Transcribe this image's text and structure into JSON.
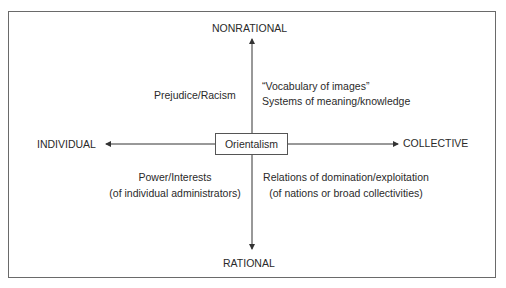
{
  "diagram": {
    "center": "Orientalism",
    "axes": {
      "top": "NONRATIONAL",
      "bottom": "RATIONAL",
      "left": "INDIVIDUAL",
      "right": "COLLECTIVE"
    },
    "quadrants": {
      "top_left": [
        "Prejudice/Racism"
      ],
      "top_right": [
        "“Vocabulary of images”",
        "Systems of meaning/knowledge"
      ],
      "bottom_left": [
        "Power/Interests",
        "(of individual administrators)"
      ],
      "bottom_right": [
        "Relations of domination/exploitation",
        "(of nations or broad collectivities)"
      ]
    },
    "colors": {
      "line": "#3a3a3a",
      "frame": "#6a6a6a",
      "text": "#2a2a2a"
    }
  }
}
